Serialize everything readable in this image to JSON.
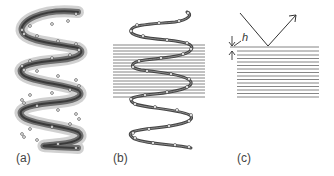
{
  "figure": {
    "panels": [
      {
        "id": "a",
        "label": "(a)",
        "description": "3D shaded helix with sample points"
      },
      {
        "id": "b",
        "label": "(b)",
        "description": "Helix projected over horizontal layered lines"
      },
      {
        "id": "c",
        "label": "(c)",
        "description": "Reflection off layered structure with layer spacing h"
      }
    ],
    "annotation_h": "h",
    "colors": {
      "helix_dark": "#3a3a3a",
      "helix_shade": "#8a8a8a",
      "lines": "#777777",
      "points": "#ffffff"
    }
  }
}
